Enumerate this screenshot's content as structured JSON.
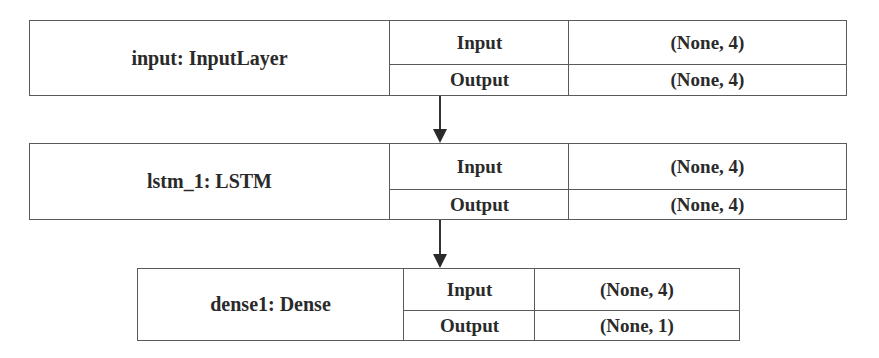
{
  "diagram": {
    "type": "keras-model-plot",
    "layers": [
      {
        "name": "input: InputLayer",
        "input_label": "Input",
        "input_shape": "(None, 4)",
        "output_label": "Output",
        "output_shape": "(None, 4)"
      },
      {
        "name": "lstm_1: LSTM",
        "input_label": "Input",
        "input_shape": "(None, 4)",
        "output_label": "Output",
        "output_shape": "(None, 4)"
      },
      {
        "name": "dense1: Dense",
        "input_label": "Input",
        "input_shape": "(None, 4)",
        "output_label": "Output",
        "output_shape": "(None, 1)"
      }
    ],
    "edges": [
      {
        "from": "input: InputLayer",
        "to": "lstm_1: LSTM"
      },
      {
        "from": "lstm_1: LSTM",
        "to": "dense1: Dense"
      }
    ]
  }
}
